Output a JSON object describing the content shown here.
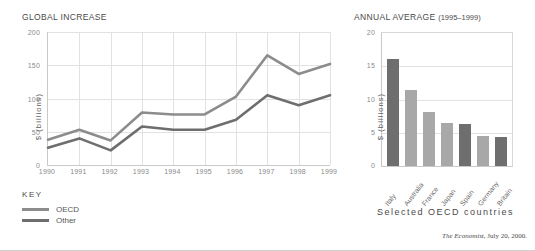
{
  "source": {
    "publication": "The Economist,",
    "details": " July 20, 2000."
  },
  "key": {
    "heading": "KEY",
    "items": [
      {
        "label": "OECD",
        "color": "#8c8c8c"
      },
      {
        "label": "Other",
        "color": "#6e6e6e"
      }
    ]
  },
  "charts": {
    "line": {
      "title": "GLOBAL INCREASE",
      "ylabel": "$ (billions)",
      "yticks": [
        "0",
        "50",
        "100",
        "150",
        "200"
      ]
    },
    "bar": {
      "title_main": "ANNUAL AVERAGE",
      "title_sub": "(1995–1999)",
      "ylabel": "$ (billions)",
      "caption": "Selected OECD countries",
      "yticks": [
        "0",
        "5",
        "10",
        "15",
        "20"
      ]
    }
  },
  "chart_data": [
    {
      "type": "line",
      "title": "GLOBAL INCREASE",
      "xlabel": "",
      "ylabel": "$ (billions)",
      "ylim": [
        0,
        200
      ],
      "yticks": [
        0,
        50,
        100,
        150,
        200
      ],
      "grid": true,
      "legend_position": "below-left",
      "x": [
        "1990",
        "1991",
        "1992",
        "1993",
        "1994",
        "1995",
        "1996",
        "1997",
        "1998",
        "1999"
      ],
      "series": [
        {
          "name": "OECD",
          "color": "#8c8c8c",
          "values": [
            38,
            53,
            37,
            79,
            76,
            76,
            103,
            165,
            137,
            152
          ]
        },
        {
          "name": "Other",
          "color": "#6e6e6e",
          "values": [
            26,
            40,
            22,
            58,
            53,
            53,
            68,
            105,
            90,
            105
          ]
        }
      ]
    },
    {
      "type": "bar",
      "title": "ANNUAL AVERAGE (1995–1999)",
      "xlabel": "Selected OECD countries",
      "ylabel": "$ (billions)",
      "ylim": [
        0,
        20
      ],
      "yticks": [
        0,
        5,
        10,
        15,
        20
      ],
      "grid": true,
      "categories": [
        "Italy",
        "Australia",
        "France",
        "Japan",
        "Spain",
        "Germany",
        "Britain"
      ],
      "values": [
        16.1,
        11.5,
        8.1,
        6.5,
        6.3,
        4.5,
        4.3
      ],
      "colors": [
        "#6e6e6e",
        "#a8a8a8",
        "#a8a8a8",
        "#a8a8a8",
        "#6e6e6e",
        "#a8a8a8",
        "#6e6e6e"
      ]
    }
  ]
}
